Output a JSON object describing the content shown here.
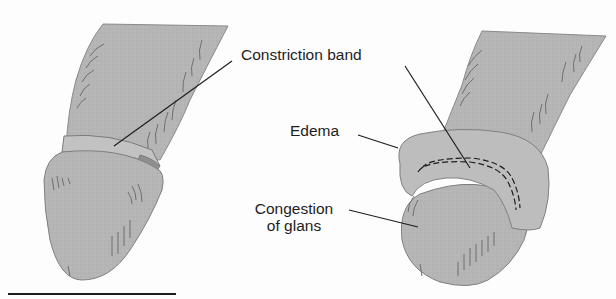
{
  "figure": {
    "type": "medical-illustration",
    "colors": {
      "background": "#fdfdfd",
      "tissue_fill": "#b3b3b3",
      "tissue_light": "#bdbdbd",
      "band_fill": "#8f8f8f",
      "outline": "#7a7a7a",
      "leader_line": "#1e1e1e",
      "text": "#1e1e1e"
    },
    "labels": {
      "constriction_band": "Constriction band",
      "edema": "Edema",
      "congestion_line1": "Congestion",
      "congestion_line2": "of glans"
    },
    "panels": [
      {
        "name": "left",
        "description": "shaft with constriction band at base of glans"
      },
      {
        "name": "right",
        "description": "edematous foreskin ring with dashed band and congested glans"
      }
    ]
  }
}
